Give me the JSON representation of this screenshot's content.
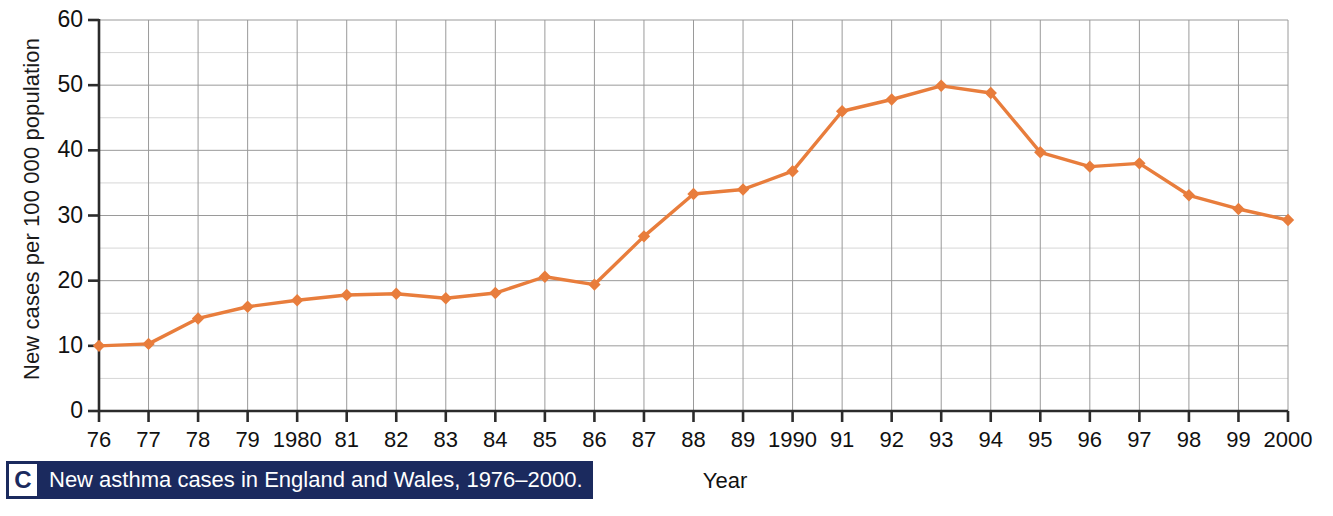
{
  "figure": {
    "caption_letter": "C",
    "caption_text": "New asthma cases in England and Wales, 1976–2000."
  },
  "chart_data": {
    "type": "line",
    "title": "",
    "xlabel": "Year",
    "ylabel": "New cases per 100 000 population",
    "categories": [
      "76",
      "77",
      "78",
      "79",
      "1980",
      "81",
      "82",
      "83",
      "84",
      "85",
      "86",
      "87",
      "88",
      "89",
      "1990",
      "91",
      "92",
      "93",
      "94",
      "95",
      "96",
      "97",
      "98",
      "99",
      "2000"
    ],
    "values": [
      10.0,
      10.3,
      14.2,
      16.0,
      17.0,
      17.8,
      18.0,
      17.3,
      18.1,
      20.6,
      19.4,
      26.8,
      33.3,
      34.0,
      36.8,
      46.0,
      47.8,
      49.9,
      48.8,
      39.7,
      37.5,
      38.0,
      33.1,
      31.0,
      29.3
    ],
    "ylim": [
      0,
      60
    ],
    "y_ticks": [
      0,
      10,
      20,
      30,
      40,
      50,
      60
    ],
    "y_tick_labels": [
      "0",
      "10",
      "20",
      "30",
      "40",
      "50",
      "60"
    ],
    "y_minor_step": 5,
    "grid": true,
    "legend": "none",
    "series": [
      {
        "name": "New asthma cases",
        "color": "#E87D3C",
        "marker": "diamond",
        "values": [
          10.0,
          10.3,
          14.2,
          16.0,
          17.0,
          17.8,
          18.0,
          17.3,
          18.1,
          20.6,
          19.4,
          26.8,
          33.3,
          34.0,
          36.8,
          46.0,
          47.8,
          49.9,
          48.8,
          39.7,
          37.5,
          38.0,
          33.1,
          31.0,
          29.3
        ]
      }
    ]
  },
  "colors": {
    "line": "#E87D3C",
    "axis": "#2b2b2b",
    "grid_major": "#9a9a9a",
    "grid_minor": "#d6d6d6",
    "caption_bg": "#1b2a5e",
    "caption_fg": "#ffffff"
  }
}
